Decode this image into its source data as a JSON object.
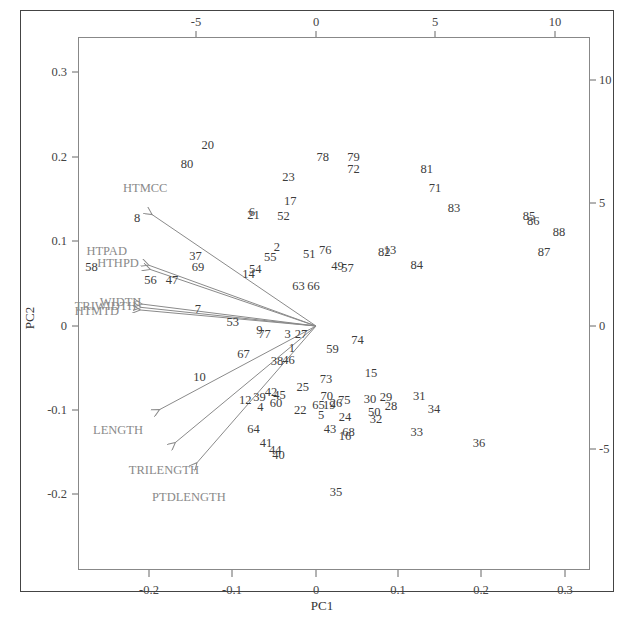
{
  "chart_data": {
    "type": "scatter",
    "subtype": "pca-biplot",
    "title": "",
    "xlabel": "PC1",
    "ylabel": "PC2",
    "xlim": [
      -0.29,
      0.33
    ],
    "ylim": [
      -0.29,
      0.34
    ],
    "grid": false,
    "legend": null,
    "bottom_axis_ticks": [
      "-0.2",
      "-0.1",
      "0",
      "0.1",
      "0.2",
      "0.3"
    ],
    "left_axis_ticks": [
      "0.3",
      "0.2",
      "0.1",
      "0",
      "-0.1",
      "-0.2"
    ],
    "top_axis_ticks": [
      "-5",
      "0",
      "5",
      "10"
    ],
    "right_axis_ticks": [
      "10",
      "5",
      "0",
      "-5"
    ],
    "observations": [
      {
        "label": "20",
        "x": -0.13,
        "y": 0.215
      },
      {
        "label": "80",
        "x": -0.155,
        "y": 0.192
      },
      {
        "label": "78",
        "x": 0.008,
        "y": 0.2
      },
      {
        "label": "79",
        "x": 0.045,
        "y": 0.2
      },
      {
        "label": "72",
        "x": 0.045,
        "y": 0.186
      },
      {
        "label": "81",
        "x": 0.133,
        "y": 0.186
      },
      {
        "label": "23",
        "x": -0.033,
        "y": 0.177
      },
      {
        "label": "71",
        "x": 0.143,
        "y": 0.163
      },
      {
        "label": "17",
        "x": -0.031,
        "y": 0.148
      },
      {
        "label": "6",
        "x": -0.077,
        "y": 0.135
      },
      {
        "label": "21",
        "x": -0.075,
        "y": 0.132
      },
      {
        "label": "52",
        "x": -0.039,
        "y": 0.13
      },
      {
        "label": "83",
        "x": 0.166,
        "y": 0.14
      },
      {
        "label": "85",
        "x": 0.256,
        "y": 0.13
      },
      {
        "label": "86",
        "x": 0.261,
        "y": 0.125
      },
      {
        "label": "88",
        "x": 0.292,
        "y": 0.112
      },
      {
        "label": "8",
        "x": -0.215,
        "y": 0.128
      },
      {
        "label": "87",
        "x": 0.274,
        "y": 0.088
      },
      {
        "label": "2",
        "x": -0.047,
        "y": 0.094
      },
      {
        "label": "55",
        "x": -0.055,
        "y": 0.082
      },
      {
        "label": "51",
        "x": -0.008,
        "y": 0.085
      },
      {
        "label": "76",
        "x": 0.011,
        "y": 0.09
      },
      {
        "label": "82",
        "x": 0.082,
        "y": 0.088
      },
      {
        "label": "13",
        "x": 0.089,
        "y": 0.09
      },
      {
        "label": "84",
        "x": 0.121,
        "y": 0.072
      },
      {
        "label": "49",
        "x": 0.026,
        "y": 0.071
      },
      {
        "label": "57",
        "x": 0.038,
        "y": 0.069
      },
      {
        "label": "37",
        "x": -0.145,
        "y": 0.083
      },
      {
        "label": "69",
        "x": -0.142,
        "y": 0.07
      },
      {
        "label": "14",
        "x": -0.081,
        "y": 0.062
      },
      {
        "label": "54",
        "x": -0.073,
        "y": 0.068
      },
      {
        "label": "58",
        "x": -0.27,
        "y": 0.07
      },
      {
        "label": "56",
        "x": -0.199,
        "y": 0.055
      },
      {
        "label": "47",
        "x": -0.173,
        "y": 0.054
      },
      {
        "label": "63",
        "x": -0.021,
        "y": 0.048
      },
      {
        "label": "66",
        "x": -0.003,
        "y": 0.048
      },
      {
        "label": "7",
        "x": -0.142,
        "y": 0.02
      },
      {
        "label": "53",
        "x": -0.1,
        "y": 0.005
      },
      {
        "label": "9",
        "x": -0.068,
        "y": -0.005
      },
      {
        "label": "77",
        "x": -0.062,
        "y": -0.01
      },
      {
        "label": "3",
        "x": -0.034,
        "y": -0.01
      },
      {
        "label": "27",
        "x": -0.018,
        "y": -0.01
      },
      {
        "label": "74",
        "x": 0.05,
        "y": -0.017
      },
      {
        "label": "59",
        "x": 0.02,
        "y": -0.027
      },
      {
        "label": "67",
        "x": -0.087,
        "y": -0.033
      },
      {
        "label": "1",
        "x": -0.029,
        "y": -0.026
      },
      {
        "label": "38",
        "x": -0.047,
        "y": -0.042
      },
      {
        "label": "46",
        "x": -0.033,
        "y": -0.04
      },
      {
        "label": "10",
        "x": -0.14,
        "y": -0.06
      },
      {
        "label": "15",
        "x": 0.066,
        "y": -0.056
      },
      {
        "label": "73",
        "x": 0.012,
        "y": -0.063
      },
      {
        "label": "25",
        "x": -0.016,
        "y": -0.072
      },
      {
        "label": "42",
        "x": -0.054,
        "y": -0.078
      },
      {
        "label": "39",
        "x": -0.068,
        "y": -0.084
      },
      {
        "label": "12",
        "x": -0.085,
        "y": -0.088
      },
      {
        "label": "45",
        "x": -0.044,
        "y": -0.082
      },
      {
        "label": "4",
        "x": -0.067,
        "y": -0.096
      },
      {
        "label": "60",
        "x": -0.048,
        "y": -0.091
      },
      {
        "label": "30",
        "x": 0.065,
        "y": -0.086
      },
      {
        "label": "29",
        "x": 0.084,
        "y": -0.084
      },
      {
        "label": "28",
        "x": 0.09,
        "y": -0.095
      },
      {
        "label": "31",
        "x": 0.124,
        "y": -0.083
      },
      {
        "label": "34",
        "x": 0.142,
        "y": -0.098
      },
      {
        "label": "70",
        "x": 0.013,
        "y": -0.083
      },
      {
        "label": "65",
        "x": 0.003,
        "y": -0.093
      },
      {
        "label": "19",
        "x": 0.016,
        "y": -0.093
      },
      {
        "label": "26",
        "x": 0.024,
        "y": -0.091
      },
      {
        "label": "75",
        "x": 0.034,
        "y": -0.088
      },
      {
        "label": "22",
        "x": -0.019,
        "y": -0.1
      },
      {
        "label": "5",
        "x": 0.006,
        "y": -0.105
      },
      {
        "label": "50",
        "x": 0.07,
        "y": -0.102
      },
      {
        "label": "32",
        "x": 0.072,
        "y": -0.11
      },
      {
        "label": "24",
        "x": 0.035,
        "y": -0.108
      },
      {
        "label": "43",
        "x": 0.017,
        "y": -0.122
      },
      {
        "label": "16",
        "x": 0.035,
        "y": -0.13
      },
      {
        "label": "68",
        "x": 0.039,
        "y": -0.126
      },
      {
        "label": "33",
        "x": 0.121,
        "y": -0.125
      },
      {
        "label": "36",
        "x": 0.196,
        "y": -0.138
      },
      {
        "label": "64",
        "x": -0.075,
        "y": -0.122
      },
      {
        "label": "41",
        "x": -0.06,
        "y": -0.139
      },
      {
        "label": "44",
        "x": -0.049,
        "y": -0.147
      },
      {
        "label": "40",
        "x": -0.045,
        "y": -0.153
      },
      {
        "label": "35",
        "x": 0.024,
        "y": -0.197
      }
    ],
    "variables": [
      {
        "label": "HTMCC",
        "arrow_end": [
          -0.197,
          0.132
        ],
        "label_pos": [
          -0.232,
          0.164
        ]
      },
      {
        "label": "HTPAD",
        "arrow_end": [
          -0.201,
          0.072
        ],
        "label_pos": [
          -0.276,
          0.089
        ]
      },
      {
        "label": "HTHPD",
        "arrow_end": [
          -0.199,
          0.067
        ],
        "label_pos": [
          -0.263,
          0.075
        ]
      },
      {
        "label": "WIDTH",
        "arrow_end": [
          -0.209,
          0.026
        ],
        "label_pos": [
          -0.26,
          0.029
        ]
      },
      {
        "label": "TRIWIDTH",
        "arrow_end": [
          -0.21,
          0.022
        ],
        "label_pos": [
          -0.29,
          0.024
        ]
      },
      {
        "label": "HTMTD",
        "arrow_end": [
          -0.211,
          0.019
        ],
        "label_pos": [
          -0.29,
          0.018
        ]
      },
      {
        "label": "LENGTH",
        "arrow_end": [
          -0.188,
          -0.099
        ],
        "label_pos": [
          -0.268,
          -0.123
        ]
      },
      {
        "label": "TRILENGTH",
        "arrow_end": [
          -0.169,
          -0.138
        ],
        "label_pos": [
          -0.225,
          -0.17
        ]
      },
      {
        "label": "PTDLENGTH",
        "arrow_end": [
          -0.143,
          -0.162
        ],
        "label_pos": [
          -0.197,
          -0.202
        ]
      }
    ]
  },
  "colors": {
    "observation_text": "#3c3c3c",
    "variable_text": "#8a8a8a",
    "arrow": "#8a8a8a",
    "frame": "#444444",
    "plot_border": "#888888"
  }
}
